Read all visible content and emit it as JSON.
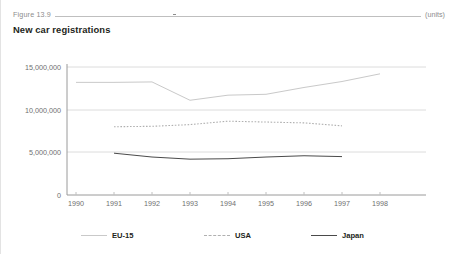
{
  "header": {
    "figure_number": "Figure 13.9",
    "units_note": "(units)",
    "title": "New car registrations"
  },
  "legend": {
    "items": [
      {
        "label": "EU-15",
        "style": "solid",
        "color": "#c9c9c9"
      },
      {
        "label": "USA",
        "style": "dashed",
        "color": "#b0b0b0"
      },
      {
        "label": "Japan",
        "style": "solid",
        "color": "#4a4a4a"
      }
    ]
  },
  "chart_data": {
    "type": "line",
    "title": "New car registrations",
    "xlabel": "",
    "ylabel": "",
    "units": "(units)",
    "x": [
      1990,
      1991,
      1992,
      1993,
      1994,
      1995,
      1996,
      1997,
      1998
    ],
    "xtick_labels": [
      "1990",
      "1991",
      "1992",
      "1993",
      "1994",
      "1995",
      "1996",
      "1997",
      "1998"
    ],
    "ytick_labels": [
      "0",
      "5,000,000",
      "10,000,000",
      "15,000,000"
    ],
    "yticks": [
      0,
      5000000,
      10000000,
      15000000
    ],
    "ylim": [
      0,
      15000000
    ],
    "grid": "horizontal",
    "legend_position": "bottom",
    "series": [
      {
        "name": "EU-15",
        "color": "#c9c9c9",
        "style": "solid",
        "x": [
          1990,
          1991,
          1992,
          1993,
          1994,
          1995,
          1996,
          1997,
          1998
        ],
        "values": [
          13200000,
          13200000,
          13250000,
          11100000,
          11700000,
          11800000,
          12600000,
          13300000,
          14200000
        ]
      },
      {
        "name": "USA",
        "color": "#b0b0b0",
        "style": "dashed",
        "x": [
          1991,
          1992,
          1993,
          1994,
          1995,
          1996,
          1997
        ],
        "values": [
          8000000,
          8050000,
          8250000,
          8650000,
          8550000,
          8450000,
          8100000
        ]
      },
      {
        "name": "Japan",
        "color": "#4a4a4a",
        "style": "solid",
        "x": [
          1991,
          1992,
          1993,
          1994,
          1995,
          1996,
          1997
        ],
        "values": [
          4900000,
          4450000,
          4200000,
          4250000,
          4450000,
          4600000,
          4500000
        ]
      }
    ]
  }
}
